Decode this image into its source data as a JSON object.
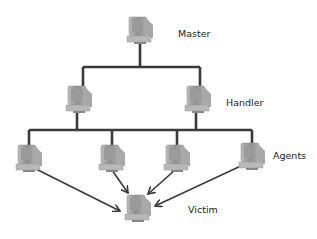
{
  "diagram": {
    "type": "ddos-hierarchy",
    "line_color": "#3a3a3a",
    "nodes": {
      "master": {
        "label": "Master",
        "count": 1
      },
      "handler": {
        "label": "Handler",
        "count": 2
      },
      "agents": {
        "label": "Agents",
        "count": 4
      },
      "victim": {
        "label": "Victim",
        "count": 1
      }
    },
    "edges": [
      {
        "from": "master",
        "to": "handler-1",
        "style": "line"
      },
      {
        "from": "master",
        "to": "handler-2",
        "style": "line"
      },
      {
        "from": "handler-1",
        "to": "agents",
        "style": "line"
      },
      {
        "from": "handler-2",
        "to": "agents",
        "style": "line"
      },
      {
        "from": "agent-1",
        "to": "victim",
        "style": "arrow"
      },
      {
        "from": "agent-2",
        "to": "victim",
        "style": "arrow"
      },
      {
        "from": "agent-3",
        "to": "victim",
        "style": "arrow"
      },
      {
        "from": "agent-4",
        "to": "victim",
        "style": "arrow"
      }
    ]
  }
}
